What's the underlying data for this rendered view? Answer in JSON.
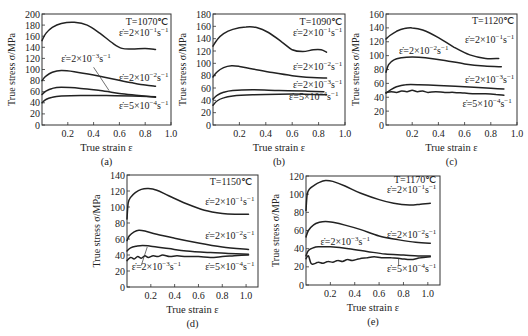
{
  "figure": {
    "panels_count": 5
  },
  "chart_data": [
    {
      "id": "a",
      "type": "line",
      "caption": "(a)",
      "title": "T=1070℃",
      "xlabel": "True strain ε",
      "ylabel": "True stress σ/MPa",
      "xlim": [
        0,
        1.0
      ],
      "ylim": [
        0,
        200
      ],
      "xticks": [
        "0.2",
        "0.4",
        "0.6",
        "0.8",
        "1.0"
      ],
      "yticks": [
        "0",
        "20",
        "40",
        "60",
        "80",
        "100",
        "120",
        "140",
        "160",
        "180",
        "200"
      ],
      "grid": false,
      "box": {
        "x": 42,
        "y": 14,
        "w": 129,
        "h": 111
      },
      "series": [
        {
          "name": "ε̇=2×10⁻¹s⁻¹",
          "x": [
            0,
            0.03,
            0.08,
            0.15,
            0.25,
            0.35,
            0.45,
            0.55,
            0.62,
            0.7,
            0.8,
            0.88
          ],
          "y": [
            152,
            165,
            176,
            183,
            185,
            180,
            165,
            147,
            138,
            137,
            138,
            136
          ]
        },
        {
          "name": "ε̇=2×10⁻²s⁻¹",
          "x": [
            0,
            0.03,
            0.08,
            0.15,
            0.25,
            0.4,
            0.55,
            0.7,
            0.8,
            0.88
          ],
          "y": [
            80,
            88,
            95,
            98,
            96,
            90,
            83,
            76,
            72,
            70
          ]
        },
        {
          "name": "ε̇=2×10⁻³s⁻¹",
          "x": [
            0,
            0.03,
            0.08,
            0.15,
            0.3,
            0.45,
            0.6,
            0.75,
            0.88
          ],
          "y": [
            55,
            61,
            66,
            68,
            66,
            62,
            57,
            53,
            50
          ]
        },
        {
          "name": "ε̇=5×10⁻⁴s⁻¹",
          "x": [
            0,
            0.03,
            0.08,
            0.15,
            0.3,
            0.5,
            0.7,
            0.88
          ],
          "y": [
            40,
            46,
            50,
            52,
            53,
            53,
            52,
            51
          ]
        }
      ],
      "labels": [
        {
          "text": "T=1070℃",
          "x": 0.98,
          "y": 180,
          "anchor": "end"
        },
        {
          "text": "ε̇=2×10⁻¹s⁻¹",
          "x": 0.98,
          "y": 161,
          "anchor": "end"
        },
        {
          "text": "ε̇=2×10⁻³s⁻¹",
          "x": 0.15,
          "y": 113,
          "anchor": "start"
        },
        {
          "text": "ε̇=2×10⁻²s⁻¹",
          "x": 0.98,
          "y": 80,
          "anchor": "end"
        },
        {
          "text": "ε̇=5×10⁻⁴s⁻¹",
          "x": 0.98,
          "y": 28,
          "anchor": "end"
        }
      ],
      "leader": {
        "x1": 0.4,
        "y1": 104,
        "x2": 0.52,
        "y2": 62
      }
    },
    {
      "id": "b",
      "type": "line",
      "caption": "(b)",
      "title": "T=1090℃",
      "xlabel": "True strain ε",
      "ylabel": "True stress σ/MPa",
      "xlim": [
        0,
        1.0
      ],
      "ylim": [
        0,
        180
      ],
      "xticks": [
        "0.2",
        "0.4",
        "0.6",
        "0.8",
        "1.0"
      ],
      "yticks": [
        "0",
        "20",
        "40",
        "60",
        "80",
        "100",
        "120",
        "140",
        "160",
        "180"
      ],
      "grid": false,
      "box": {
        "x": 213,
        "y": 14,
        "w": 132,
        "h": 111
      },
      "series": [
        {
          "name": "ε̇=2×10⁻¹s⁻¹",
          "x": [
            0,
            0.03,
            0.08,
            0.15,
            0.25,
            0.33,
            0.42,
            0.52,
            0.6,
            0.68,
            0.76,
            0.82,
            0.86
          ],
          "y": [
            128,
            138,
            148,
            155,
            159,
            158,
            150,
            135,
            122,
            119,
            122,
            122,
            118
          ]
        },
        {
          "name": "ε̇=2×10⁻²s⁻¹",
          "x": [
            0,
            0.03,
            0.08,
            0.14,
            0.2,
            0.3,
            0.45,
            0.6,
            0.75,
            0.86
          ],
          "y": [
            78,
            86,
            93,
            96,
            95,
            91,
            85,
            80,
            77,
            76
          ]
        },
        {
          "name": "ε̇=2×10⁻³s⁻¹",
          "x": [
            0,
            0.03,
            0.08,
            0.15,
            0.3,
            0.5,
            0.7,
            0.84
          ],
          "y": [
            42,
            48,
            53,
            56,
            57,
            56,
            55,
            54
          ]
        },
        {
          "name": "ε̇=5×10⁻⁴s⁻¹",
          "x": [
            0,
            0.03,
            0.08,
            0.15,
            0.3,
            0.5,
            0.7,
            0.86
          ],
          "y": [
            32,
            39,
            44,
            47,
            49,
            50,
            50,
            49
          ]
        }
      ],
      "labels": [
        {
          "text": "T=1090℃",
          "x": 0.98,
          "y": 162,
          "anchor": "end"
        },
        {
          "text": "ε̇=2×10⁻¹s⁻¹",
          "x": 0.98,
          "y": 144,
          "anchor": "end"
        },
        {
          "text": "ε̇=2×10⁻²s⁻¹",
          "x": 0.98,
          "y": 90,
          "anchor": "end"
        },
        {
          "text": "ε̇=2×10⁻³s⁻¹",
          "x": 0.98,
          "y": 60,
          "anchor": "end"
        },
        {
          "text": "ε̇=5×10⁻⁴s⁻¹",
          "x": 0.95,
          "y": 40,
          "anchor": "end"
        }
      ]
    },
    {
      "id": "c",
      "type": "line",
      "caption": "(c)",
      "title": "T=1120℃",
      "xlabel": "True strain ε",
      "ylabel": "True stress σ/MPa",
      "xlim": [
        0,
        1.0
      ],
      "ylim": [
        0,
        160
      ],
      "xticks": [
        "0.2",
        "0.4",
        "0.6",
        "0.8",
        "1.0"
      ],
      "yticks": [
        "0",
        "20",
        "40",
        "60",
        "80",
        "100",
        "120",
        "140",
        "160"
      ],
      "grid": false,
      "box": {
        "x": 386,
        "y": 14,
        "w": 131,
        "h": 111
      },
      "series": [
        {
          "name": "ε̇=2×10⁻¹s⁻¹",
          "x": [
            0,
            0.03,
            0.08,
            0.14,
            0.2,
            0.28,
            0.4,
            0.52,
            0.64,
            0.76,
            0.86
          ],
          "y": [
            124,
            129,
            135,
            139,
            140,
            137,
            126,
            112,
            101,
            96,
            96
          ]
        },
        {
          "name": "ε̇=2×10⁻²s⁻¹",
          "x": [
            0,
            0.02,
            0.06,
            0.12,
            0.2,
            0.3,
            0.45,
            0.6,
            0.75,
            0.88
          ],
          "y": [
            76,
            87,
            94,
            97,
            98,
            97,
            93,
            88,
            85,
            84
          ]
        },
        {
          "name": "ε̇=2×10⁻³s⁻¹",
          "x": [
            0,
            0.03,
            0.08,
            0.15,
            0.25,
            0.4,
            0.6,
            0.8,
            0.9
          ],
          "y": [
            46,
            50,
            55,
            58,
            58,
            57,
            55,
            53,
            52
          ]
        },
        {
          "name": "ε̇=5×10⁻⁴s⁻¹",
          "x": [
            0,
            0.04,
            0.08,
            0.12,
            0.16,
            0.2,
            0.24,
            0.28,
            0.32,
            0.38,
            0.45,
            0.52,
            0.6,
            0.68,
            0.76,
            0.84,
            0.9
          ],
          "y": [
            47,
            48,
            47,
            49,
            48,
            50,
            48,
            49,
            47,
            48,
            47,
            47,
            46,
            45,
            45,
            44,
            43
          ]
        }
      ],
      "labels": [
        {
          "text": "T=1120℃",
          "x": 0.98,
          "y": 145,
          "anchor": "end"
        },
        {
          "text": "ε̇=2×10⁻¹s⁻¹",
          "x": 0.98,
          "y": 118,
          "anchor": "end"
        },
        {
          "text": "ε̇=2×10⁻²s⁻¹",
          "x": 0.1,
          "y": 103,
          "anchor": "start"
        },
        {
          "text": "ε̇=2×10⁻³s⁻¹",
          "x": 0.98,
          "y": 61,
          "anchor": "end"
        },
        {
          "text": "ε̇=5×10⁻⁴s⁻¹",
          "x": 0.96,
          "y": 26,
          "anchor": "end"
        }
      ]
    },
    {
      "id": "d",
      "type": "line",
      "caption": "(d)",
      "title": "T=1150℃",
      "xlabel": "True strain ε",
      "ylabel": "True stress σ/MPa",
      "xlim": [
        0,
        1.1
      ],
      "ylim": [
        0,
        140
      ],
      "xticks": [
        "0.2",
        "0.4",
        "0.6",
        "0.8",
        "1.0"
      ],
      "yticks": [
        "0",
        "20",
        "40",
        "60",
        "80",
        "100",
        "120",
        "140"
      ],
      "grid": false,
      "box": {
        "x": 127,
        "y": 175,
        "w": 131,
        "h": 112
      },
      "series": [
        {
          "name": "ε̇=2×10⁻¹s⁻¹",
          "x": [
            0,
            0.01,
            0.03,
            0.07,
            0.12,
            0.18,
            0.25,
            0.35,
            0.5,
            0.65,
            0.8,
            0.92,
            1.02
          ],
          "y": [
            85,
            105,
            112,
            118,
            122,
            123,
            121,
            114,
            104,
            96,
            92,
            91,
            91
          ]
        },
        {
          "name": "ε̇=2×10⁻²s⁻¹",
          "x": [
            0,
            0.02,
            0.06,
            0.1,
            0.15,
            0.25,
            0.4,
            0.6,
            0.8,
            1.02
          ],
          "y": [
            58,
            64,
            69,
            71,
            70,
            66,
            61,
            55,
            50,
            47
          ]
        },
        {
          "name": "ε̇=2×10⁻³s⁻¹",
          "x": [
            0,
            0.03,
            0.08,
            0.13,
            0.2,
            0.35,
            0.5,
            0.7,
            0.85,
            1.02
          ],
          "y": [
            45,
            49,
            51,
            52,
            51,
            48,
            45,
            43,
            42,
            41
          ]
        },
        {
          "name": "ε̇=5×10⁻⁴s⁻¹",
          "x": [
            0,
            0.03,
            0.06,
            0.09,
            0.12,
            0.15,
            0.18,
            0.22,
            0.26,
            0.3,
            0.36,
            0.42,
            0.5,
            0.6,
            0.7,
            0.8,
            0.9,
            1.02
          ],
          "y": [
            33,
            37,
            35,
            38,
            36,
            39,
            37,
            39,
            38,
            40,
            38,
            39,
            38,
            38,
            37,
            38,
            39,
            40
          ]
        }
      ],
      "labels": [
        {
          "text": "T=1150℃",
          "x": 1.05,
          "y": 128,
          "anchor": "end"
        },
        {
          "text": "ε̇=2×10⁻¹s⁻¹",
          "x": 1.07,
          "y": 103,
          "anchor": "end"
        },
        {
          "text": "ε̇=2×10⁻²s⁻¹",
          "x": 1.07,
          "y": 60,
          "anchor": "end"
        },
        {
          "text": "ε̇=2×10⁻³s⁻¹",
          "x": 0.04,
          "y": 21,
          "anchor": "start"
        },
        {
          "text": "ε̇=5×10⁻⁴s⁻¹",
          "x": 1.07,
          "y": 21,
          "anchor": "end"
        }
      ],
      "leader": {
        "x1": 0.12,
        "y1": 27,
        "x2": 0.17,
        "y2": 50
      }
    },
    {
      "id": "e",
      "type": "line",
      "caption": "(e)",
      "title": "T=1170℃",
      "xlabel": "True strain ε",
      "ylabel": "True stress σ/MPa",
      "xlim": [
        0,
        1.1
      ],
      "ylim": [
        0,
        120
      ],
      "xticks": [
        "0.2",
        "0.4",
        "0.6",
        "0.8",
        "1.0"
      ],
      "yticks": [
        "0",
        "20",
        "40",
        "60",
        "80",
        "100",
        "120"
      ],
      "grid": false,
      "box": {
        "x": 306,
        "y": 176,
        "w": 134,
        "h": 109
      },
      "series": [
        {
          "name": "ε̇=2×10⁻¹s⁻¹",
          "x": [
            0,
            0.01,
            0.03,
            0.07,
            0.11,
            0.16,
            0.22,
            0.32,
            0.45,
            0.6,
            0.72,
            0.85,
            0.94,
            1.02
          ],
          "y": [
            82,
            100,
            106,
            110,
            113,
            115,
            114,
            109,
            101,
            94,
            90,
            88,
            89,
            90
          ]
        },
        {
          "name": "ε̇=2×10⁻²s⁻¹",
          "x": [
            0,
            0.02,
            0.06,
            0.11,
            0.16,
            0.22,
            0.32,
            0.45,
            0.6,
            0.75,
            0.9,
            1.02
          ],
          "y": [
            53,
            60,
            66,
            69,
            70,
            69,
            66,
            61,
            54,
            50,
            47,
            46
          ]
        },
        {
          "name": "ε̇=2×10⁻³s⁻¹",
          "x": [
            0,
            0.02,
            0.06,
            0.1,
            0.2,
            0.35,
            0.5,
            0.65,
            0.8,
            0.92,
            1.02
          ],
          "y": [
            32,
            38,
            41,
            42,
            42,
            40,
            37,
            34,
            33,
            32,
            32
          ]
        },
        {
          "name": "ε̇=5×10⁻⁴s⁻¹",
          "x": [
            0,
            0.02,
            0.04,
            0.06,
            0.1,
            0.14,
            0.18,
            0.22,
            0.26,
            0.3,
            0.34,
            0.38,
            0.44,
            0.5,
            0.56,
            0.62,
            0.7,
            0.78,
            0.86,
            0.94,
            1.02
          ],
          "y": [
            29,
            32,
            24,
            23,
            25,
            24,
            26,
            25,
            27,
            26,
            28,
            27,
            29,
            30,
            31,
            30,
            30,
            29,
            28,
            30,
            31
          ]
        }
      ],
      "labels": [
        {
          "text": "T=1170℃",
          "x": 1.07,
          "y": 112,
          "anchor": "end"
        },
        {
          "text": "ε̇=2×10⁻¹s⁻¹",
          "x": 1.07,
          "y": 101,
          "anchor": "end"
        },
        {
          "text": "ε̇=2×10⁻²s⁻¹",
          "x": 1.07,
          "y": 52,
          "anchor": "end"
        },
        {
          "text": "ε̇=2×10⁻³s⁻¹",
          "x": 0.12,
          "y": 44,
          "anchor": "start"
        },
        {
          "text": "ε̇=5×10⁻⁴s⁻¹",
          "x": 1.07,
          "y": 14,
          "anchor": "end"
        }
      ],
      "leader": {
        "x1": 0.76,
        "y1": 22,
        "x2": 0.76,
        "y2": 29
      }
    }
  ]
}
